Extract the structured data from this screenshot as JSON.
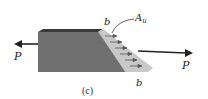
{
  "diagram": {
    "caption": "(c)",
    "labels": {
      "force_left": "P",
      "force_right": "P",
      "edge_top": "b",
      "edge_bottom": "b",
      "area_main": "A",
      "area_sub": "u"
    },
    "colors": {
      "front_face": "#6f6f6f",
      "top_face": "#3a3a3a",
      "inclined_face": "#c9c9c9",
      "arrow": "#222222",
      "stress_arrows": "#555555"
    },
    "stress_arrow_count": 6
  }
}
